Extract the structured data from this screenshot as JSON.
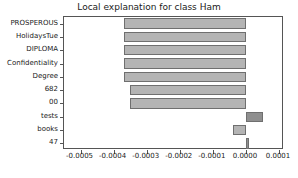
{
  "chart_data": {
    "type": "bar",
    "orientation": "horizontal",
    "title": "Local explanation for class Ham",
    "xlabel": "",
    "ylabel": "",
    "categories": [
      "PROSPEROUS",
      "HolidaysTue",
      "DIPLOMA",
      "Confidentiality",
      "Degree",
      "682",
      "00",
      "tests",
      "books",
      "47"
    ],
    "values": [
      -0.00037,
      -0.00037,
      -0.00037,
      -0.00037,
      -0.00037,
      -0.00035,
      -0.00035,
      5.2e-05,
      -3.8e-05,
      8e-06
    ],
    "xlim": [
      -0.00055,
      0.000115
    ],
    "xticks": [
      -0.0005,
      -0.0004,
      -0.0003,
      -0.0002,
      -0.0001,
      0.0,
      0.0001
    ],
    "xticklabels": [
      "-0.0005",
      "-0.0004",
      "-0.0003",
      "-0.0002",
      "-0.0001",
      "0.0000",
      "0.0001"
    ],
    "grid": false,
    "legend": null,
    "colors": {
      "negative_bar": "#b4b4b4",
      "positive_bar": "#8f8f8f",
      "bar_edge": "#6f6f6f",
      "axis": "#555555",
      "text": "#1a1a1a",
      "background": "#ffffff"
    }
  }
}
